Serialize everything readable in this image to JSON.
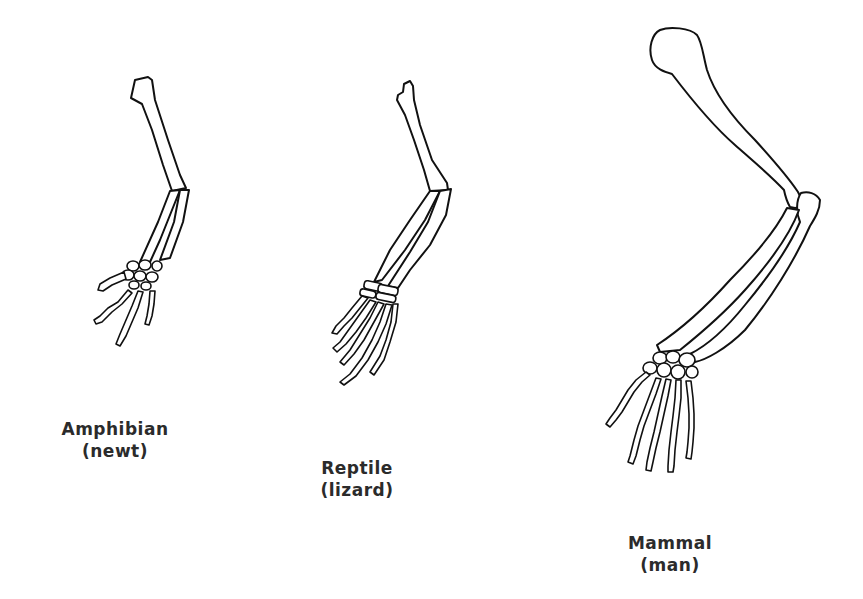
{
  "diagram": {
    "figures": [
      {
        "id": "amphibian",
        "class_label": "Amphibian",
        "example_label": "(newt)"
      },
      {
        "id": "reptile",
        "class_label": "Reptile",
        "example_label": "(lizard)"
      },
      {
        "id": "mammal",
        "class_label": "Mammal",
        "example_label": "(man)"
      }
    ],
    "colors": {
      "stroke": "#111111",
      "text": "#2b2b2b",
      "background": "#ffffff"
    }
  }
}
